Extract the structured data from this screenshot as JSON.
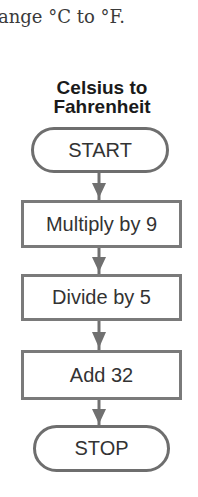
{
  "intro_text": "ange °C to °F.",
  "flowchart": {
    "title_line1": "Celsius to",
    "title_line2": "Fahrenheit",
    "steps": [
      {
        "type": "terminal",
        "label": "START"
      },
      {
        "type": "process",
        "label": "Multiply by 9"
      },
      {
        "type": "process",
        "label": "Divide by 5"
      },
      {
        "type": "process",
        "label": "Add 32"
      },
      {
        "type": "terminal",
        "label": "STOP"
      }
    ],
    "colors": {
      "border": "#6e6e6e",
      "arrow": "#707070",
      "text": "#333333"
    }
  }
}
